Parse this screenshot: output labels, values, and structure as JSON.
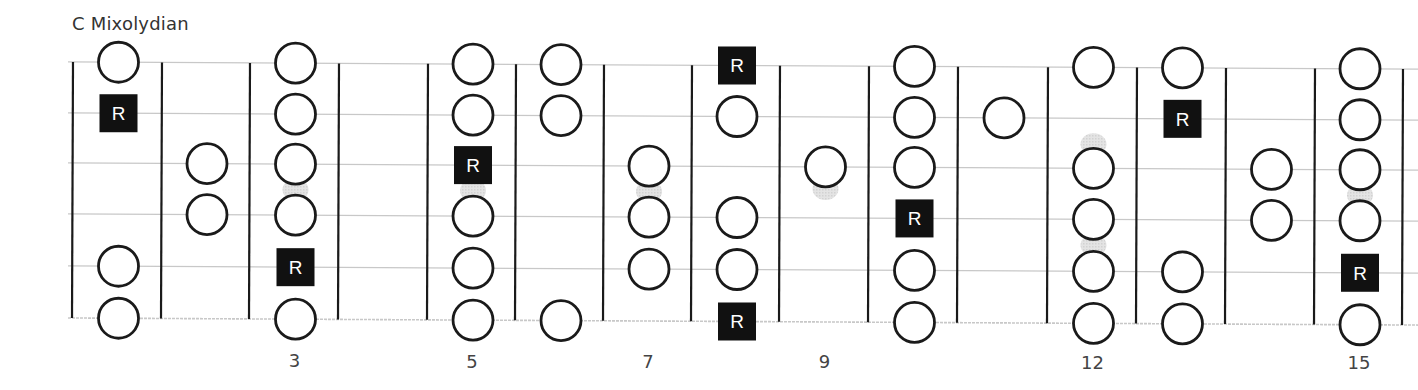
{
  "title": "C Mixolydian",
  "colors": {
    "string_line": "#c8c8c8",
    "fret_line": "#1a1a1a",
    "note_stroke": "#1a1a1a",
    "root_fill": "#111111",
    "root_text": "#ffffff",
    "shadow": "#d2d2d2",
    "label": "#444444"
  },
  "fretboard": {
    "strings": 6,
    "frets_shown": [
      1,
      2,
      3,
      4,
      5,
      6,
      7,
      8,
      9,
      10,
      11,
      12,
      13,
      14,
      15
    ],
    "fret_labels": [
      {
        "fret": 3,
        "label": "3"
      },
      {
        "fret": 5,
        "label": "5"
      },
      {
        "fret": 7,
        "label": "7"
      },
      {
        "fret": 9,
        "label": "9"
      },
      {
        "fret": 12,
        "label": "12"
      },
      {
        "fret": 15,
        "label": "15"
      }
    ],
    "root_label": "R"
  },
  "notes": [
    {
      "fret": 1,
      "string": 1,
      "type": "note"
    },
    {
      "fret": 1,
      "string": 2,
      "type": "root"
    },
    {
      "fret": 1,
      "string": 5,
      "type": "note"
    },
    {
      "fret": 1,
      "string": 6,
      "type": "note"
    },
    {
      "fret": 2,
      "string": 3,
      "type": "note"
    },
    {
      "fret": 2,
      "string": 4,
      "type": "note"
    },
    {
      "fret": 3,
      "string": 1,
      "type": "note"
    },
    {
      "fret": 3,
      "string": 2,
      "type": "note"
    },
    {
      "fret": 3,
      "string": 3,
      "type": "note"
    },
    {
      "fret": 3,
      "string": 4,
      "type": "note"
    },
    {
      "fret": 3,
      "string": 5,
      "type": "root"
    },
    {
      "fret": 3,
      "string": 6,
      "type": "note"
    },
    {
      "fret": 5,
      "string": 1,
      "type": "note"
    },
    {
      "fret": 5,
      "string": 2,
      "type": "note"
    },
    {
      "fret": 5,
      "string": 3,
      "type": "root"
    },
    {
      "fret": 5,
      "string": 4,
      "type": "note"
    },
    {
      "fret": 5,
      "string": 5,
      "type": "note"
    },
    {
      "fret": 5,
      "string": 6,
      "type": "note"
    },
    {
      "fret": 6,
      "string": 1,
      "type": "note"
    },
    {
      "fret": 6,
      "string": 2,
      "type": "note"
    },
    {
      "fret": 6,
      "string": 6,
      "type": "note"
    },
    {
      "fret": 7,
      "string": 3,
      "type": "note"
    },
    {
      "fret": 7,
      "string": 4,
      "type": "note"
    },
    {
      "fret": 7,
      "string": 5,
      "type": "note"
    },
    {
      "fret": 8,
      "string": 1,
      "type": "root"
    },
    {
      "fret": 8,
      "string": 2,
      "type": "note"
    },
    {
      "fret": 8,
      "string": 4,
      "type": "note"
    },
    {
      "fret": 8,
      "string": 5,
      "type": "note"
    },
    {
      "fret": 8,
      "string": 6,
      "type": "root"
    },
    {
      "fret": 9,
      "string": 3,
      "type": "note"
    },
    {
      "fret": 10,
      "string": 1,
      "type": "note"
    },
    {
      "fret": 10,
      "string": 2,
      "type": "note"
    },
    {
      "fret": 10,
      "string": 3,
      "type": "note"
    },
    {
      "fret": 10,
      "string": 4,
      "type": "root"
    },
    {
      "fret": 10,
      "string": 5,
      "type": "note"
    },
    {
      "fret": 10,
      "string": 6,
      "type": "note"
    },
    {
      "fret": 11,
      "string": 2,
      "type": "note"
    },
    {
      "fret": 12,
      "string": 1,
      "type": "note"
    },
    {
      "fret": 12,
      "string": 3,
      "type": "note"
    },
    {
      "fret": 12,
      "string": 4,
      "type": "note"
    },
    {
      "fret": 12,
      "string": 5,
      "type": "note"
    },
    {
      "fret": 12,
      "string": 6,
      "type": "note"
    },
    {
      "fret": 13,
      "string": 1,
      "type": "note"
    },
    {
      "fret": 13,
      "string": 2,
      "type": "root"
    },
    {
      "fret": 13,
      "string": 5,
      "type": "note"
    },
    {
      "fret": 13,
      "string": 6,
      "type": "note"
    },
    {
      "fret": 14,
      "string": 3,
      "type": "note"
    },
    {
      "fret": 14,
      "string": 4,
      "type": "note"
    },
    {
      "fret": 15,
      "string": 1,
      "type": "note"
    },
    {
      "fret": 15,
      "string": 2,
      "type": "note"
    },
    {
      "fret": 15,
      "string": 3,
      "type": "note"
    },
    {
      "fret": 15,
      "string": 4,
      "type": "note"
    },
    {
      "fret": 15,
      "string": 5,
      "type": "root"
    },
    {
      "fret": 15,
      "string": 6,
      "type": "note"
    }
  ],
  "shadows": [
    {
      "fret": 3,
      "between": [
        3,
        4
      ]
    },
    {
      "fret": 5,
      "between": [
        3,
        4
      ]
    },
    {
      "fret": 7,
      "between": [
        3,
        4
      ]
    },
    {
      "fret": 9,
      "below_string": 3
    },
    {
      "fret": 12,
      "above_string": 3
    },
    {
      "fret": 12,
      "between": [
        4,
        5
      ]
    },
    {
      "fret": 15,
      "between": [
        3,
        4
      ]
    }
  ]
}
